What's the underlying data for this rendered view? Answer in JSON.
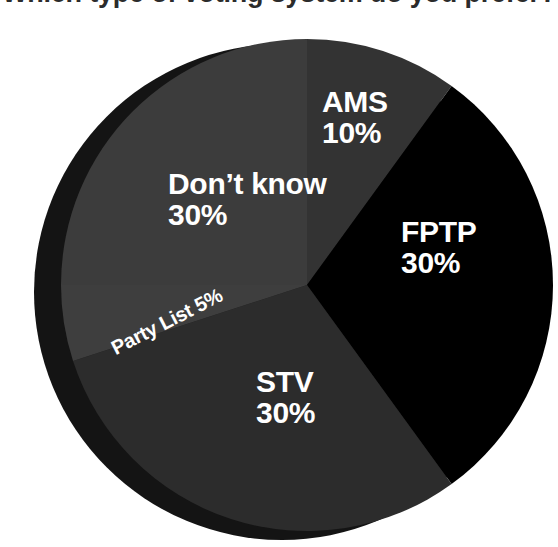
{
  "chart_data": {
    "type": "pie",
    "title": "Which type of voting system do you prefer?",
    "categories": [
      "AMS",
      "FPTP",
      "STV",
      "Party List",
      "Don't know"
    ],
    "values": [
      10,
      30,
      30,
      5,
      30
    ],
    "unit": "%",
    "legend": "none",
    "grid": false,
    "start_angle_deg": 0,
    "direction": "clockwise",
    "slices": [
      {
        "label": "AMS",
        "value": 10,
        "value_text": "10%",
        "display": "AMS\n10%",
        "color": "#333333",
        "start_deg": 0,
        "end_deg": 36
      },
      {
        "label": "FPTP",
        "value": 30,
        "value_text": "30%",
        "display": "FPTP\n30%",
        "color": "#000000",
        "start_deg": 36,
        "end_deg": 144
      },
      {
        "label": "STV",
        "value": 30,
        "value_text": "30%",
        "display": "STV\n30%",
        "color": "#2c2c2c",
        "start_deg": 144,
        "end_deg": 252
      },
      {
        "label": "Party List",
        "value": 5,
        "value_text": "5%",
        "display": "Party List 5%",
        "color": "#3e3e3e",
        "start_deg": 252,
        "end_deg": 270
      },
      {
        "label": "Don't know",
        "value": 30,
        "value_text": "30%",
        "display": "Don’t know\n30%",
        "color": "#3c3c3c",
        "start_deg": 270,
        "end_deg": 360
      }
    ],
    "colors": {
      "background": "#ffffff",
      "shadow": "#141414",
      "label_text": "#ffffff",
      "title_text": "#2b2b2b"
    }
  },
  "labels": {
    "ams": "AMS\n10%",
    "fptp": "FPTP\n30%",
    "stv": "STV\n30%",
    "dont_know": "Don’t know\n30%",
    "party_list": "Party List 5%"
  }
}
